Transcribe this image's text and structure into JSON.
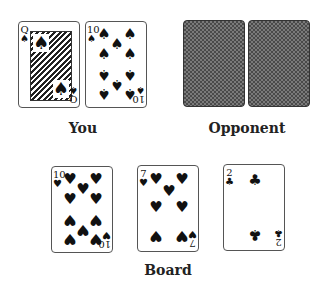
{
  "players": {
    "you": {
      "label": "You",
      "cards": [
        {
          "rank": "Q",
          "suit": "♠",
          "suit_name": "spades",
          "face_up": true
        },
        {
          "rank": "10",
          "suit": "♠",
          "suit_name": "spades",
          "face_up": true
        }
      ]
    },
    "opponent": {
      "label": "Opponent",
      "cards": [
        {
          "face_up": false
        },
        {
          "face_up": false
        }
      ]
    }
  },
  "board": {
    "label": "Board",
    "cards": [
      {
        "rank": "10",
        "suit": "♥",
        "suit_name": "hearts",
        "face_up": true
      },
      {
        "rank": "7",
        "suit": "♥",
        "suit_name": "hearts",
        "face_up": true
      },
      {
        "rank": "2",
        "suit": "♣",
        "suit_name": "clubs",
        "face_up": true
      }
    ]
  },
  "colors": {
    "card_border": "#555555",
    "card_back": "#4a4a4a",
    "ink": "#111111"
  }
}
